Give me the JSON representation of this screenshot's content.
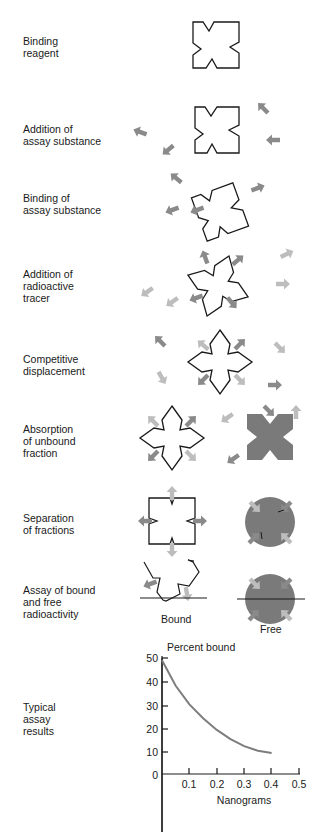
{
  "steps": [
    {
      "label": "Binding\nreagent"
    },
    {
      "label": "Addition of\nassay substance"
    },
    {
      "label": "Binding of\nassay substance"
    },
    {
      "label": "Addition of\nradioactive\ntracer"
    },
    {
      "label": "Competitive\ndisplacement"
    },
    {
      "label": "Absorption\nof unbound\nfraction"
    },
    {
      "label": "Separation\nof fractions"
    },
    {
      "label": "Assay of bound\nand free\nradioactivity"
    },
    {
      "label": "Typical\nassay\nresults"
    }
  ],
  "captions": {
    "bound": "Bound",
    "free": "Free"
  },
  "colors": {
    "outline": "#1a1a1a",
    "arrow_dark": "#8a8a8a",
    "arrow_light": "#bdbdbd",
    "fill_dark": "#7a7a7a",
    "curve": "#7d7d7d"
  },
  "chart_data": {
    "type": "line",
    "title": "",
    "ylabel": "Percent bound",
    "xlabel": "Nanograms",
    "x_ticks": [
      "0.1",
      "0.2",
      "0.3",
      "0.4",
      "0.5"
    ],
    "y_ticks": [
      "0",
      "10",
      "20",
      "30",
      "40",
      "50"
    ],
    "xlim": [
      0,
      0.5
    ],
    "ylim": [
      0,
      50
    ],
    "grid": false,
    "series": [
      {
        "name": "Percent bound",
        "x": [
          0.0,
          0.05,
          0.1,
          0.15,
          0.2,
          0.25,
          0.3,
          0.35,
          0.4
        ],
        "y": [
          49,
          38,
          30,
          24,
          19,
          15,
          12,
          10,
          9
        ]
      }
    ]
  }
}
